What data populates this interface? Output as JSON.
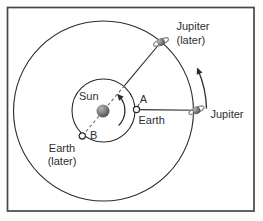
{
  "figure_title": "Earth and Jupiter orbit diagram",
  "colors": {
    "background": "#fdfdfd",
    "frame": "#474747",
    "line": "#2b2b2b",
    "dashed": "#6b6b6b",
    "text": "#2e2e2e",
    "ring": "#8f8f8f",
    "ball_light": "#b5b5b5",
    "ball_dark": "#474747"
  },
  "labels": {
    "sun": "Sun",
    "point_a": "A",
    "earth": "Earth",
    "point_b": "B",
    "earth_later": {
      "line1": "Earth",
      "line2": "(later)"
    },
    "jupiter": "Jupiter",
    "jupiter_later": {
      "line1": "Jupiter",
      "line2": "(later)"
    }
  },
  "icons": {
    "sun": "sun-disk",
    "jupiter": "ringed-planet",
    "jupiter_later": "ringed-planet",
    "earth_position_a": "open-circle-marker",
    "earth_position_b": "open-circle-marker",
    "orbital_direction": "curved-arrow"
  },
  "diagram": {
    "orbits": [
      {
        "name": "earth-orbit",
        "shape": "circle"
      },
      {
        "name": "jupiter-orbit",
        "shape": "circle"
      }
    ],
    "direction": "counterclockwise"
  }
}
